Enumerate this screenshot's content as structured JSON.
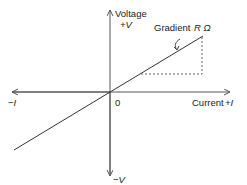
{
  "diagram": {
    "type": "iv_characteristic",
    "y_axis": {
      "label": "Voltage",
      "positive": "+V",
      "negative": "−V"
    },
    "x_axis": {
      "label": "Current",
      "positive_symbol": "+I",
      "negative": "−I"
    },
    "origin_label": "0",
    "annotation": {
      "text": "Gradient",
      "symbol": "R Ω"
    },
    "colors": {
      "line": "#333333",
      "axis": "#555555",
      "dashed": "#555555"
    }
  }
}
